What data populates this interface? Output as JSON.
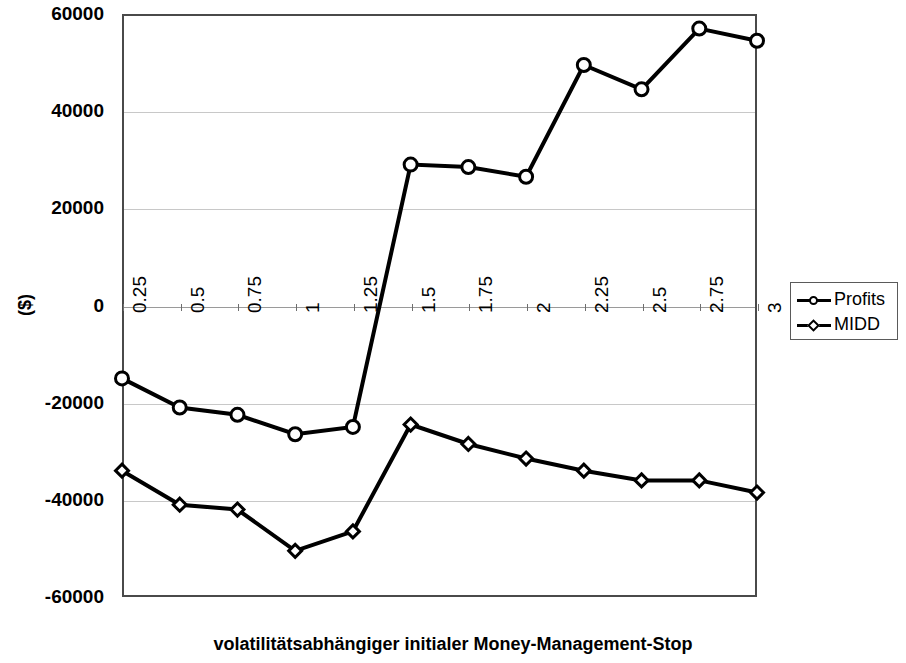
{
  "chart_data": {
    "type": "line",
    "title": "",
    "xlabel": "volatilitätsabhängiger initialer Money-Management-Stop",
    "ylabel": "($)",
    "categories": [
      "0.25",
      "0.5",
      "0.75",
      "1",
      "1.25",
      "1.5",
      "1.75",
      "2",
      "2.25",
      "2.5",
      "2.75",
      "3"
    ],
    "ylim": [
      -60000,
      60000
    ],
    "yticks": [
      "60000",
      "40000",
      "20000",
      "0",
      "-20000",
      "-40000",
      "-60000"
    ],
    "ytick_values": [
      60000,
      40000,
      20000,
      0,
      -20000,
      -40000,
      -60000
    ],
    "grid": true,
    "legend_position": "right",
    "series": [
      {
        "name": "Profits",
        "marker": "circle",
        "color": "#000000",
        "values": [
          -15000,
          -21000,
          -22500,
          -26500,
          -25000,
          29000,
          28500,
          26500,
          49500,
          44500,
          57000,
          54500
        ]
      },
      {
        "name": "MIDD",
        "marker": "diamond",
        "color": "#000000",
        "values": [
          -34000,
          -41000,
          -42000,
          -50500,
          -46500,
          -24500,
          -28500,
          -31500,
          -34000,
          -36000,
          -36000,
          -38500
        ]
      }
    ]
  },
  "legend": {
    "items": [
      {
        "label": "Profits",
        "marker": "circle"
      },
      {
        "label": "MIDD",
        "marker": "diamond"
      }
    ]
  },
  "axes": {
    "y_title": "($)",
    "x_title": "volatilitätsabhängiger initialer Money-Management-Stop"
  }
}
